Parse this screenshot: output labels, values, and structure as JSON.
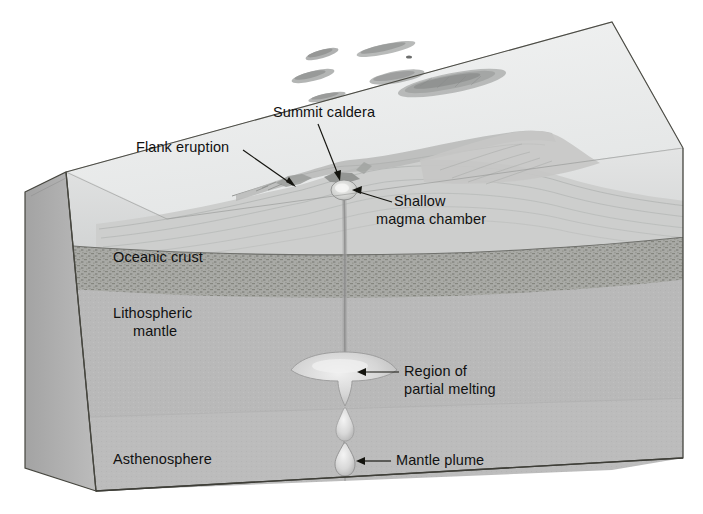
{
  "figure": {
    "background_color": "#ffffff"
  },
  "palette": {
    "sea_surface": "#eceeee",
    "sea_surface_shade": "#e2e4e5",
    "left_face": "#b4b4b4",
    "left_face_dark": "#a2a2a2",
    "water_layer": "#d8d9d9",
    "volcano_flank": "#cfd0d0",
    "oceanic_crust": "#a8a9a6",
    "oceanic_crust_speckle": "#8e8f8b",
    "lithospheric_mantle": "#b9b9b9",
    "asthenosphere": "#bcbcbc",
    "plume": "#e6e6e6",
    "outline": "#3a3a38",
    "label_color": "#111111",
    "leader_color": "#14140f"
  },
  "labels": [
    {
      "id": "flank-eruption",
      "lines": [
        "Flank eruption"
      ],
      "text_x": 136,
      "text_y": 152,
      "anchor": "start",
      "leader": {
        "x1": 243,
        "y1": 150,
        "x2": 296,
        "y2": 187
      }
    },
    {
      "id": "summit-caldera",
      "lines": [
        "Summit caldera"
      ],
      "text_x": 273,
      "text_y": 117,
      "anchor": "start",
      "leader": {
        "x1": 318,
        "y1": 124,
        "x2": 340,
        "y2": 181
      }
    },
    {
      "id": "shallow-magma-chamber",
      "lines": [
        "Shallow",
        "magma chamber"
      ],
      "text_x": 394,
      "text_y": 206,
      "anchor": "start",
      "leader": {
        "x1": 392,
        "y1": 202,
        "x2": 352,
        "y2": 190
      }
    },
    {
      "id": "oceanic-crust",
      "lines": [
        "Oceanic crust"
      ],
      "text_x": 113,
      "text_y": 262,
      "anchor": "start",
      "leader": null
    },
    {
      "id": "lithospheric-mantle",
      "lines": [
        "Lithospheric",
        "mantle"
      ],
      "text_x": 113,
      "text_y": 318,
      "anchor": "start",
      "leader": null
    },
    {
      "id": "region-of-partial-melting",
      "lines": [
        "Region of",
        "partial melting"
      ],
      "text_x": 404,
      "text_y": 376,
      "anchor": "start",
      "leader": {
        "x1": 399,
        "y1": 372,
        "x2": 357,
        "y2": 372
      }
    },
    {
      "id": "asthenosphere",
      "lines": [
        "Asthenosphere"
      ],
      "text_x": 113,
      "text_y": 464,
      "anchor": "start",
      "leader": null
    },
    {
      "id": "mantle-plume",
      "lines": [
        "Mantle plume"
      ],
      "text_x": 396,
      "text_y": 465,
      "anchor": "start",
      "leader": {
        "x1": 391,
        "y1": 461,
        "x2": 356,
        "y2": 461
      }
    }
  ],
  "features": {
    "island_chain_count": 7,
    "plume_blob_count": 2,
    "melt_region": "mushroom-shaped region of partial melting",
    "conduit": "vertical magma conduit from plume to summit"
  }
}
